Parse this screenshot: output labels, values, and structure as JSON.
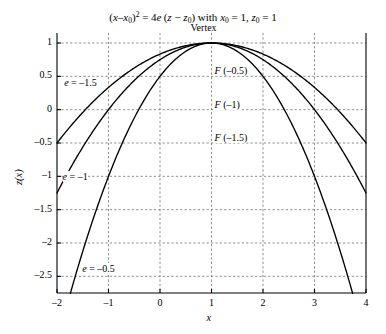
{
  "chart_data": {
    "type": "line",
    "title_parts": {
      "lhs_var": "x",
      "lhs_sub": "0",
      "rhs_coef": "4",
      "rhs_e": "e",
      "rhs_z": "z",
      "rhs_zsub": "0",
      "with": "with",
      "x0_value": "1",
      "z0_value": "1"
    },
    "xlabel": "x",
    "ylabel": "z(x)",
    "xlim": [
      -2,
      4
    ],
    "ylim": [
      -2.75,
      1.15
    ],
    "xticks": [
      "–2",
      "–1",
      "0",
      "1",
      "2",
      "3",
      "4"
    ],
    "xtick_values": [
      -2,
      -1,
      0,
      1,
      2,
      3,
      4
    ],
    "yticks": [
      "1",
      "0.5",
      "0",
      "–0.5",
      "–1",
      "–1.5",
      "–2",
      "–2.5"
    ],
    "ytick_values": [
      1,
      0.5,
      0,
      -0.5,
      -1,
      -1.5,
      -2,
      -2.5
    ],
    "grid": true,
    "grid_style": "dashed",
    "grid_color": "#808080",
    "axis_color": "#000000",
    "curve_color": "#000000",
    "legend": "none",
    "vertex": {
      "x": 1,
      "z": 1
    },
    "equation": "z = z0 + (x - x0)^2 / (4e)",
    "series": [
      {
        "name": "e = –0.5",
        "e": -0.5,
        "x": [
          -2,
          -1.5,
          -1,
          -0.5,
          0,
          0.5,
          1,
          1.5,
          2,
          2.5,
          3,
          3.2
        ],
        "values": [
          -3.5,
          -2.125,
          -1.0,
          -0.125,
          0.5,
          0.875,
          1.0,
          0.875,
          0.5,
          -0.125,
          -1.0,
          -1.42
        ]
      },
      {
        "name": "e = –1",
        "e": -1,
        "x": [
          -2,
          -1.5,
          -1,
          -0.5,
          0,
          0.5,
          1,
          1.5,
          2,
          2.5,
          3,
          3.5,
          4
        ],
        "values": [
          -1.25,
          -0.5625,
          -0.0,
          0.4375,
          0.75,
          0.9375,
          1.0,
          0.9375,
          0.75,
          0.4375,
          0.0,
          -0.5625,
          -1.25
        ]
      },
      {
        "name": "e = –1.5",
        "e": -1.5,
        "x": [
          -2,
          -1.5,
          -1,
          -0.5,
          0,
          0.5,
          1,
          1.5,
          2,
          2.5,
          3,
          3.5,
          4
        ],
        "values": [
          -0.5,
          -0.0417,
          0.3333,
          0.625,
          0.8333,
          0.9583,
          1.0,
          0.9583,
          0.8333,
          0.625,
          0.3333,
          -0.0417,
          -0.5
        ]
      }
    ],
    "annotations": [
      {
        "id": "vertex",
        "text": "Vertex",
        "x": 1.0,
        "z": 1.22
      },
      {
        "id": "focus-05",
        "text": "F (–0.5)",
        "x": 1.02,
        "z": 0.5
      },
      {
        "id": "focus-1",
        "text": "F (–1)",
        "x": 1.02,
        "z": 0.0
      },
      {
        "id": "focus-15",
        "text": "F (–1.5)",
        "x": 1.02,
        "z": -0.5
      },
      {
        "id": "e-15",
        "text": "e = –1.5",
        "x": -1.9,
        "z": 0.32
      },
      {
        "id": "e-1",
        "text": "e = –1",
        "x": -1.93,
        "z": -1.08
      },
      {
        "id": "e-05",
        "text": "e = –0.5",
        "x": -1.55,
        "z": -2.47
      }
    ]
  }
}
